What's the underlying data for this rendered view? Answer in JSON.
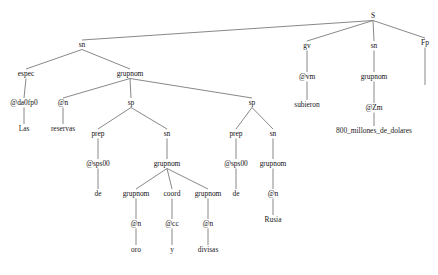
{
  "diagram": {
    "sentence": "Las reservas de oro y divisas de Rusia subieron 800_millones_de_dolares .",
    "language": "es",
    "colors": {
      "background": "#ffffff",
      "edge": "#7a7a7a",
      "label": "#111111"
    },
    "canvas": {
      "width": 438,
      "height": 275
    },
    "nodes": [
      {
        "id": "s",
        "label": "S",
        "x": 373,
        "y": 18,
        "kind": "phrase"
      },
      {
        "id": "sn1",
        "label": "sn",
        "x": 82,
        "y": 47,
        "kind": "phrase"
      },
      {
        "id": "gv",
        "label": "gv",
        "x": 307,
        "y": 48,
        "kind": "phrase"
      },
      {
        "id": "sn_obj",
        "label": "sn",
        "x": 374,
        "y": 48,
        "kind": "phrase"
      },
      {
        "id": "fp",
        "label": "Fp",
        "x": 425,
        "y": 45,
        "kind": "pos"
      },
      {
        "id": "espec",
        "label": "espec",
        "x": 26,
        "y": 76,
        "kind": "phrase"
      },
      {
        "id": "grupnom1",
        "label": "grupnom",
        "x": 130,
        "y": 76,
        "kind": "phrase"
      },
      {
        "id": "vm",
        "label": "@vm",
        "x": 307,
        "y": 79,
        "kind": "pos"
      },
      {
        "id": "grupnom_obj",
        "label": "grupnom",
        "x": 374,
        "y": 79,
        "kind": "phrase"
      },
      {
        "id": "da0fp0",
        "label": "@da0fp0",
        "x": 24,
        "y": 105,
        "kind": "pos"
      },
      {
        "id": "n_reservas",
        "label": "@n",
        "x": 63,
        "y": 105,
        "kind": "pos"
      },
      {
        "id": "sp1",
        "label": "sp",
        "x": 131,
        "y": 105,
        "kind": "phrase"
      },
      {
        "id": "sp2",
        "label": "sp",
        "x": 252,
        "y": 105,
        "kind": "phrase"
      },
      {
        "id": "subieron",
        "label": "subieron",
        "x": 307,
        "y": 107,
        "kind": "terminal"
      },
      {
        "id": "zm",
        "label": "@Zm",
        "x": 374,
        "y": 110,
        "kind": "pos"
      },
      {
        "id": "las",
        "label": "Las",
        "x": 24,
        "y": 131,
        "kind": "terminal"
      },
      {
        "id": "reservas",
        "label": "reservas",
        "x": 63,
        "y": 131,
        "kind": "terminal"
      },
      {
        "id": "prep1",
        "label": "prep",
        "x": 98,
        "y": 136,
        "kind": "phrase"
      },
      {
        "id": "sn2",
        "label": "sn",
        "x": 167,
        "y": 136,
        "kind": "phrase"
      },
      {
        "id": "prep2",
        "label": "prep",
        "x": 236,
        "y": 136,
        "kind": "phrase"
      },
      {
        "id": "sn3",
        "label": "sn",
        "x": 273,
        "y": 136,
        "kind": "phrase"
      },
      {
        "id": "importe",
        "label": "800_millones_de_dolares",
        "x": 374,
        "y": 133,
        "kind": "terminal"
      },
      {
        "id": "sps00_1",
        "label": "@sps00",
        "x": 98,
        "y": 166,
        "kind": "pos"
      },
      {
        "id": "grupnom2",
        "label": "grupnom",
        "x": 167,
        "y": 166,
        "kind": "phrase"
      },
      {
        "id": "sps00_2",
        "label": "@sps00",
        "x": 236,
        "y": 166,
        "kind": "pos"
      },
      {
        "id": "grupnom3",
        "label": "grupnom",
        "x": 273,
        "y": 166,
        "kind": "phrase"
      },
      {
        "id": "de1",
        "label": "de",
        "x": 98,
        "y": 196,
        "kind": "terminal"
      },
      {
        "id": "grupnom4",
        "label": "grupnom",
        "x": 136,
        "y": 196,
        "kind": "phrase"
      },
      {
        "id": "coord",
        "label": "coord",
        "x": 172,
        "y": 196,
        "kind": "phrase"
      },
      {
        "id": "grupnom5",
        "label": "grupnom",
        "x": 208,
        "y": 196,
        "kind": "phrase"
      },
      {
        "id": "de2",
        "label": "de",
        "x": 236,
        "y": 196,
        "kind": "terminal"
      },
      {
        "id": "n_rusia",
        "label": "@n",
        "x": 273,
        "y": 196,
        "kind": "pos"
      },
      {
        "id": "n_oro",
        "label": "@n",
        "x": 136,
        "y": 226,
        "kind": "pos"
      },
      {
        "id": "cc_y",
        "label": "@cc",
        "x": 172,
        "y": 226,
        "kind": "pos"
      },
      {
        "id": "n_divisas",
        "label": "@n",
        "x": 208,
        "y": 226,
        "kind": "pos"
      },
      {
        "id": "rusia",
        "label": "Rusia",
        "x": 273,
        "y": 222,
        "kind": "terminal"
      },
      {
        "id": "oro",
        "label": "oro",
        "x": 136,
        "y": 252,
        "kind": "terminal"
      },
      {
        "id": "y",
        "label": "y",
        "x": 172,
        "y": 252,
        "kind": "terminal"
      },
      {
        "id": "divisas",
        "label": "divisas",
        "x": 208,
        "y": 252,
        "kind": "terminal"
      },
      {
        "id": "punto",
        "label": "",
        "x": 425,
        "y": 92,
        "kind": "terminal"
      }
    ],
    "edges": [
      {
        "from": "s",
        "to": "sn1"
      },
      {
        "from": "s",
        "to": "gv"
      },
      {
        "from": "s",
        "to": "sn_obj"
      },
      {
        "from": "s",
        "to": "fp"
      },
      {
        "from": "sn1",
        "to": "espec"
      },
      {
        "from": "sn1",
        "to": "grupnom1"
      },
      {
        "from": "espec",
        "to": "da0fp0"
      },
      {
        "from": "grupnom1",
        "to": "n_reservas"
      },
      {
        "from": "grupnom1",
        "to": "sp1"
      },
      {
        "from": "grupnom1",
        "to": "sp2"
      },
      {
        "from": "da0fp0",
        "to": "las"
      },
      {
        "from": "n_reservas",
        "to": "reservas"
      },
      {
        "from": "sp1",
        "to": "prep1"
      },
      {
        "from": "sp1",
        "to": "sn2"
      },
      {
        "from": "prep1",
        "to": "sps00_1"
      },
      {
        "from": "sn2",
        "to": "grupnom2"
      },
      {
        "from": "sps00_1",
        "to": "de1"
      },
      {
        "from": "grupnom2",
        "to": "grupnom4"
      },
      {
        "from": "grupnom2",
        "to": "coord"
      },
      {
        "from": "grupnom2",
        "to": "grupnom5"
      },
      {
        "from": "grupnom4",
        "to": "n_oro"
      },
      {
        "from": "coord",
        "to": "cc_y"
      },
      {
        "from": "grupnom5",
        "to": "n_divisas"
      },
      {
        "from": "n_oro",
        "to": "oro"
      },
      {
        "from": "cc_y",
        "to": "y"
      },
      {
        "from": "n_divisas",
        "to": "divisas"
      },
      {
        "from": "sp2",
        "to": "prep2"
      },
      {
        "from": "sp2",
        "to": "sn3"
      },
      {
        "from": "prep2",
        "to": "sps00_2"
      },
      {
        "from": "sn3",
        "to": "grupnom3"
      },
      {
        "from": "sps00_2",
        "to": "de2"
      },
      {
        "from": "grupnom3",
        "to": "n_rusia"
      },
      {
        "from": "n_rusia",
        "to": "rusia"
      },
      {
        "from": "gv",
        "to": "vm"
      },
      {
        "from": "vm",
        "to": "subieron"
      },
      {
        "from": "sn_obj",
        "to": "grupnom_obj"
      },
      {
        "from": "grupnom_obj",
        "to": "zm"
      },
      {
        "from": "zm",
        "to": "importe"
      },
      {
        "from": "fp",
        "to": "punto"
      }
    ]
  }
}
